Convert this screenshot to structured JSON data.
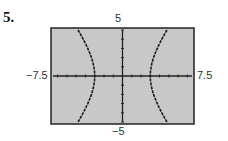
{
  "problem": {
    "number": "5."
  },
  "window": {
    "xmin": "-7.5",
    "xmax": "7.5",
    "ymin": "-5",
    "ymax": "5"
  },
  "labels": {
    "top": "5",
    "bottom": "−5",
    "left": "−7.5",
    "right": "7.5"
  },
  "colors": {
    "screen_bg": "#c8c8c8",
    "frame": "#222222",
    "curve": "#1a1a1a",
    "axes": "#222222"
  },
  "chart_data": {
    "type": "line",
    "title": "",
    "xlabel": "",
    "ylabel": "",
    "xlim": [
      -7.5,
      7.5
    ],
    "ylim": [
      -5,
      5
    ],
    "xtick_step": 1,
    "ytick_step": 1,
    "grid": false,
    "series": [
      {
        "name": "right branch",
        "x": [
          4.8,
          4.2,
          3.6,
          3.2,
          3.0,
          3.2,
          3.6,
          4.2,
          4.8
        ],
        "y": [
          5,
          3.9,
          2.6,
          1.5,
          0,
          -1.5,
          -2.6,
          -3.9,
          -5
        ]
      },
      {
        "name": "left branch",
        "x": [
          -4.8,
          -4.2,
          -3.6,
          -3.2,
          -3.0,
          -3.2,
          -3.6,
          -4.2,
          -4.8
        ],
        "y": [
          5,
          3.9,
          2.6,
          1.5,
          0,
          -1.5,
          -2.6,
          -3.9,
          -5
        ]
      }
    ]
  }
}
